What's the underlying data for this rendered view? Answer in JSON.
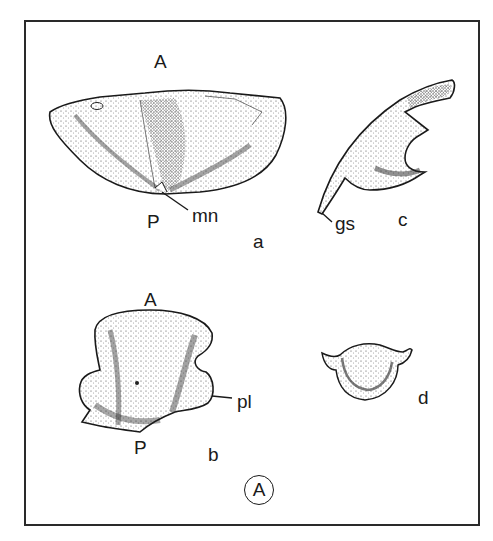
{
  "figure": {
    "panel_label": "A",
    "views": [
      {
        "id": "a",
        "label": "a",
        "orientation_top": "A",
        "orientation_bottom": "P",
        "annotations": [
          "mn"
        ]
      },
      {
        "id": "b",
        "label": "b",
        "orientation_top": "A",
        "orientation_bottom": "P",
        "annotations": [
          "pl"
        ]
      },
      {
        "id": "c",
        "label": "c",
        "annotations": [
          "gs"
        ]
      },
      {
        "id": "d",
        "label": "d",
        "annotations": []
      }
    ],
    "labels": {
      "a_top": "A",
      "a_bottom": "P",
      "a_mn": "mn",
      "a_view": "a",
      "c_gs": "gs",
      "c_view": "c",
      "b_top": "A",
      "b_bottom": "P",
      "b_pl": "pl",
      "b_view": "b",
      "d_view": "d"
    },
    "colors": {
      "ink": "#1a1a1a",
      "stipple": "#333333",
      "background": "#ffffff"
    }
  }
}
